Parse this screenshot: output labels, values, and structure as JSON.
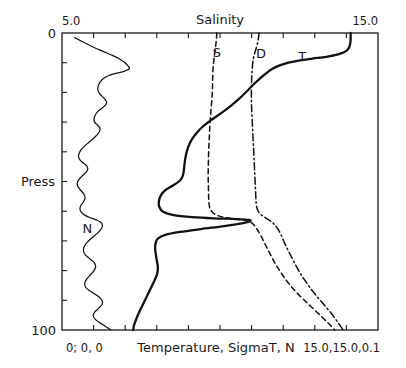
{
  "chart_data": {
    "type": "line",
    "title": "Salinity",
    "xlabel": "Temperature, SigmaT, N",
    "ylabel": "Press",
    "orientation": "vertical-profile",
    "grid": false,
    "legend_position": "inline-annotations",
    "top_axis": {
      "label": "Salinity",
      "min_label": "5.0",
      "max_label": "15.0",
      "min": 5.0,
      "max": 15.0,
      "tick_count": 9
    },
    "bottom_axis": {
      "label": "Temperature, SigmaT, N",
      "min_label": "0; 0, 0",
      "max_label": "15.0,15.0,0.1",
      "min": 0,
      "max": 15.0,
      "tick_count": 9
    },
    "y_axis": {
      "label": "Press",
      "min_label": "0",
      "max_label": "100",
      "min": 0,
      "max": 100,
      "inverted": true,
      "tick_count": 9
    },
    "series": [
      {
        "name": "T",
        "label": "T",
        "description": "Temperature",
        "style": "solid",
        "points": [
          [
            13.7,
            0
          ],
          [
            13.7,
            2.5
          ],
          [
            13.65,
            4.5
          ],
          [
            13.5,
            6.0
          ],
          [
            13.1,
            7.2
          ],
          [
            12.55,
            8.0
          ],
          [
            11.9,
            8.6
          ],
          [
            11.3,
            9.2
          ],
          [
            10.75,
            10.0
          ],
          [
            10.3,
            11.0
          ],
          [
            9.95,
            12.2
          ],
          [
            9.65,
            13.8
          ],
          [
            9.35,
            15.6
          ],
          [
            9.05,
            17.6
          ],
          [
            8.75,
            19.8
          ],
          [
            8.4,
            22.2
          ],
          [
            8.0,
            24.6
          ],
          [
            7.55,
            27.0
          ],
          [
            7.1,
            29.2
          ],
          [
            6.7,
            31.4
          ],
          [
            6.4,
            33.6
          ],
          [
            6.15,
            36.0
          ],
          [
            5.98,
            38.6
          ],
          [
            5.88,
            41.2
          ],
          [
            5.82,
            43.8
          ],
          [
            5.78,
            46.4
          ],
          [
            5.72,
            48.4
          ],
          [
            5.55,
            50.0
          ],
          [
            5.25,
            51.4
          ],
          [
            4.92,
            52.8
          ],
          [
            4.7,
            54.6
          ],
          [
            4.6,
            56.6
          ],
          [
            4.62,
            58.6
          ],
          [
            4.8,
            60.2
          ],
          [
            5.3,
            61.3
          ],
          [
            6.2,
            62.0
          ],
          [
            7.2,
            62.4
          ],
          [
            8.1,
            62.6
          ],
          [
            8.7,
            62.8
          ],
          [
            8.95,
            63.2
          ],
          [
            8.6,
            64.0
          ],
          [
            7.7,
            65.0
          ],
          [
            6.6,
            66.0
          ],
          [
            5.6,
            67.0
          ],
          [
            4.9,
            68.0
          ],
          [
            4.55,
            69.2
          ],
          [
            4.45,
            70.6
          ],
          [
            4.42,
            72.4
          ],
          [
            4.45,
            74.4
          ],
          [
            4.5,
            76.6
          ],
          [
            4.55,
            78.8
          ],
          [
            4.52,
            81.0
          ],
          [
            4.4,
            83.2
          ],
          [
            4.25,
            85.4
          ],
          [
            4.1,
            87.6
          ],
          [
            3.95,
            89.8
          ],
          [
            3.8,
            92.0
          ],
          [
            3.65,
            94.2
          ],
          [
            3.52,
            96.4
          ],
          [
            3.42,
            98.4
          ],
          [
            3.38,
            100
          ]
        ]
      },
      {
        "name": "S",
        "label": "S",
        "description": "Salinity",
        "style": "dashed",
        "points": [
          [
            7.35,
            0
          ],
          [
            7.33,
            2.0
          ],
          [
            7.3,
            4.0
          ],
          [
            7.26,
            6.0
          ],
          [
            7.22,
            8.5
          ],
          [
            7.18,
            11.0
          ],
          [
            7.16,
            13.5
          ],
          [
            7.15,
            16.0
          ],
          [
            7.14,
            19.0
          ],
          [
            7.12,
            22.0
          ],
          [
            7.08,
            25.0
          ],
          [
            7.05,
            28.0
          ],
          [
            7.02,
            31.0
          ],
          [
            7.0,
            34.0
          ],
          [
            6.98,
            37.0
          ],
          [
            6.96,
            40.0
          ],
          [
            6.95,
            43.0
          ],
          [
            6.94,
            46.0
          ],
          [
            6.94,
            49.0
          ],
          [
            6.95,
            52.0
          ],
          [
            6.96,
            55.0
          ],
          [
            6.98,
            57.5
          ],
          [
            7.05,
            59.5
          ],
          [
            7.25,
            61.0
          ],
          [
            7.65,
            62.0
          ],
          [
            8.2,
            62.6
          ],
          [
            8.65,
            63.0
          ],
          [
            8.95,
            63.6
          ],
          [
            9.1,
            64.6
          ],
          [
            9.25,
            66.0
          ],
          [
            9.42,
            68.0
          ],
          [
            9.6,
            70.5
          ],
          [
            9.78,
            73.0
          ],
          [
            9.96,
            75.5
          ],
          [
            10.15,
            78.0
          ],
          [
            10.38,
            80.5
          ],
          [
            10.62,
            83.0
          ],
          [
            10.9,
            85.5
          ],
          [
            11.22,
            88.0
          ],
          [
            11.58,
            90.5
          ],
          [
            11.95,
            93.0
          ],
          [
            12.32,
            95.5
          ],
          [
            12.68,
            98.0
          ],
          [
            12.95,
            100
          ]
        ]
      },
      {
        "name": "D",
        "label": "D",
        "description": "SigmaT / Density",
        "style": "dash-dot",
        "points": [
          [
            9.35,
            0
          ],
          [
            9.32,
            2.0
          ],
          [
            9.26,
            4.0
          ],
          [
            9.18,
            6.0
          ],
          [
            9.1,
            8.0
          ],
          [
            9.05,
            10.5
          ],
          [
            9.02,
            13.0
          ],
          [
            9.0,
            16.0
          ],
          [
            8.99,
            19.0
          ],
          [
            8.99,
            22.0
          ],
          [
            9.0,
            25.0
          ],
          [
            9.02,
            28.0
          ],
          [
            9.04,
            31.0
          ],
          [
            9.06,
            34.0
          ],
          [
            9.08,
            37.0
          ],
          [
            9.1,
            40.0
          ],
          [
            9.12,
            43.0
          ],
          [
            9.14,
            46.0
          ],
          [
            9.16,
            49.0
          ],
          [
            9.18,
            52.0
          ],
          [
            9.2,
            55.0
          ],
          [
            9.22,
            57.5
          ],
          [
            9.28,
            59.5
          ],
          [
            9.42,
            61.0
          ],
          [
            9.65,
            62.2
          ],
          [
            9.92,
            63.4
          ],
          [
            10.1,
            64.6
          ],
          [
            10.25,
            66.0
          ],
          [
            10.4,
            68.0
          ],
          [
            10.55,
            70.5
          ],
          [
            10.72,
            73.0
          ],
          [
            10.9,
            75.5
          ],
          [
            11.08,
            78.0
          ],
          [
            11.28,
            80.5
          ],
          [
            11.5,
            83.0
          ],
          [
            11.75,
            85.5
          ],
          [
            12.02,
            88.0
          ],
          [
            12.32,
            90.5
          ],
          [
            12.62,
            93.0
          ],
          [
            12.9,
            95.5
          ],
          [
            13.15,
            98.0
          ],
          [
            13.35,
            100
          ]
        ]
      },
      {
        "name": "N",
        "label": "N",
        "description": "Brunt-Vaisala frequency",
        "style": "solid-thin",
        "points": [
          [
            0.6,
            1.5
          ],
          [
            1.05,
            3.2
          ],
          [
            1.5,
            4.8
          ],
          [
            1.95,
            6.2
          ],
          [
            2.35,
            7.4
          ],
          [
            2.7,
            8.6
          ],
          [
            2.95,
            9.8
          ],
          [
            3.12,
            11.0
          ],
          [
            3.2,
            12.0
          ],
          [
            2.95,
            12.9
          ],
          [
            2.55,
            13.6
          ],
          [
            2.2,
            14.4
          ],
          [
            1.95,
            15.4
          ],
          [
            1.8,
            16.6
          ],
          [
            1.72,
            17.8
          ],
          [
            1.7,
            19.2
          ],
          [
            1.78,
            20.4
          ],
          [
            1.92,
            21.4
          ],
          [
            2.05,
            22.4
          ],
          [
            2.12,
            23.4
          ],
          [
            2.05,
            24.4
          ],
          [
            1.88,
            25.4
          ],
          [
            1.7,
            26.4
          ],
          [
            1.58,
            27.6
          ],
          [
            1.52,
            28.8
          ],
          [
            1.55,
            30.0
          ],
          [
            1.68,
            31.0
          ],
          [
            1.8,
            32.0
          ],
          [
            1.78,
            33.2
          ],
          [
            1.65,
            34.4
          ],
          [
            1.48,
            35.6
          ],
          [
            1.28,
            36.8
          ],
          [
            1.08,
            38.0
          ],
          [
            0.92,
            39.2
          ],
          [
            0.82,
            40.4
          ],
          [
            0.78,
            41.6
          ],
          [
            0.86,
            42.8
          ],
          [
            1.02,
            43.8
          ],
          [
            1.18,
            44.8
          ],
          [
            1.22,
            46.0
          ],
          [
            1.1,
            47.2
          ],
          [
            0.92,
            48.4
          ],
          [
            0.78,
            49.6
          ],
          [
            0.72,
            50.8
          ],
          [
            0.78,
            52.0
          ],
          [
            0.92,
            53.2
          ],
          [
            1.05,
            54.4
          ],
          [
            1.1,
            55.6
          ],
          [
            1.02,
            56.8
          ],
          [
            0.9,
            58.0
          ],
          [
            0.85,
            59.2
          ],
          [
            0.92,
            60.4
          ],
          [
            1.1,
            61.4
          ],
          [
            1.35,
            62.2
          ],
          [
            1.62,
            62.9
          ],
          [
            1.85,
            63.8
          ],
          [
            1.92,
            65.0
          ],
          [
            1.82,
            66.4
          ],
          [
            1.62,
            67.8
          ],
          [
            1.38,
            69.2
          ],
          [
            1.18,
            70.6
          ],
          [
            1.05,
            72.0
          ],
          [
            1.02,
            73.4
          ],
          [
            1.12,
            74.8
          ],
          [
            1.32,
            76.0
          ],
          [
            1.52,
            77.2
          ],
          [
            1.6,
            78.6
          ],
          [
            1.52,
            80.0
          ],
          [
            1.35,
            81.4
          ],
          [
            1.18,
            82.8
          ],
          [
            1.08,
            84.2
          ],
          [
            1.12,
            85.6
          ],
          [
            1.32,
            86.8
          ],
          [
            1.58,
            88.0
          ],
          [
            1.8,
            89.2
          ],
          [
            1.92,
            90.4
          ],
          [
            1.88,
            91.6
          ],
          [
            1.72,
            92.8
          ],
          [
            1.55,
            94.0
          ],
          [
            1.48,
            95.2
          ],
          [
            1.58,
            96.4
          ],
          [
            1.8,
            97.6
          ],
          [
            2.08,
            98.8
          ],
          [
            2.32,
            100
          ]
        ]
      }
    ],
    "annotations": [
      {
        "text": "S",
        "x": 7.35,
        "y": 8.0
      },
      {
        "text": "D",
        "x": 9.45,
        "y": 8.5
      },
      {
        "text": "T",
        "x": 11.4,
        "y": 9.5
      },
      {
        "text": "N",
        "x": 1.2,
        "y": 67.5
      }
    ]
  }
}
